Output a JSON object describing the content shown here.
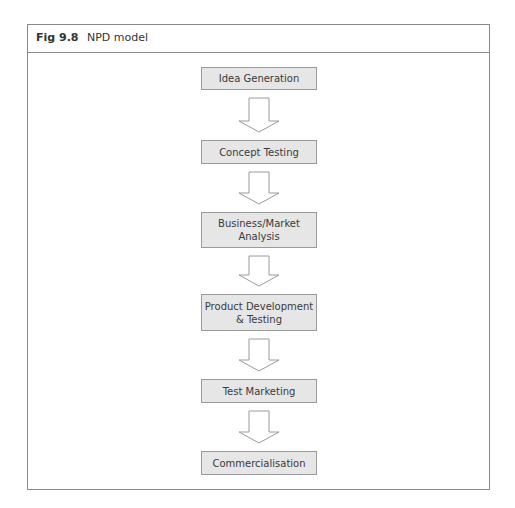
{
  "figure": {
    "number": "Fig 9.8",
    "title": "NPD model"
  },
  "diagram": {
    "type": "vertical-flowchart",
    "colors": {
      "box_fill": "#e6e6e6",
      "box_border": "#9a9a9a",
      "arrow_fill": "#ffffff",
      "arrow_stroke": "#9a9a9a",
      "frame_border": "#8a8a8a"
    },
    "steps": [
      {
        "label": "Idea Generation"
      },
      {
        "label": "Concept Testing"
      },
      {
        "label": "Business/Market\nAnalysis"
      },
      {
        "label": "Product  Development\n& Testing"
      },
      {
        "label": "Test Marketing"
      },
      {
        "label": "Commercialisation"
      }
    ],
    "edges": [
      {
        "from": 0,
        "to": 1
      },
      {
        "from": 1,
        "to": 2
      },
      {
        "from": 2,
        "to": 3
      },
      {
        "from": 3,
        "to": 4
      },
      {
        "from": 4,
        "to": 5
      }
    ]
  }
}
